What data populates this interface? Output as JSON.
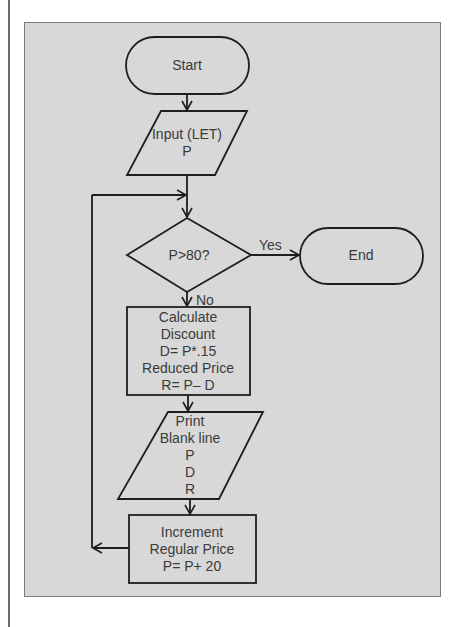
{
  "diagram": {
    "nodes": {
      "start": {
        "type": "terminator",
        "label": "Start"
      },
      "input": {
        "type": "io",
        "lines": [
          "Input (LET)",
          "P"
        ]
      },
      "decision": {
        "type": "decision",
        "label": "P>80?"
      },
      "end": {
        "type": "terminator",
        "label": "End"
      },
      "calculate": {
        "type": "process",
        "lines": [
          "Calculate",
          "Discount",
          "D= P*.15",
          "Reduced Price",
          "R= P– D"
        ]
      },
      "print": {
        "type": "io",
        "lines": [
          "Print",
          "Blank line",
          "P",
          "D",
          "R"
        ]
      },
      "increment": {
        "type": "process",
        "lines": [
          "Increment",
          "Regular Price",
          "P= P+ 20"
        ]
      }
    },
    "edges": {
      "yes_label": "Yes",
      "no_label": "No"
    },
    "colors": {
      "panel_bg": "#d8d8d8",
      "stroke": "#1e1e1e",
      "text": "#3a3a3a"
    }
  }
}
